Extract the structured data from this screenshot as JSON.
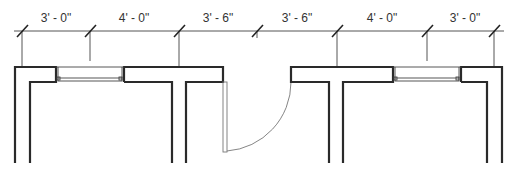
{
  "drawing": {
    "type": "architectural floor plan (partial)",
    "dimension_line": {
      "y": 31,
      "ticks_x": [
        22,
        90,
        179,
        257,
        337,
        427,
        494
      ],
      "segments": [
        {
          "label": "3' - 0\"",
          "x": 56
        },
        {
          "label": "4' - 0\"",
          "x": 134
        },
        {
          "label": "3' - 6\"",
          "x": 218
        },
        {
          "label": "3' - 6\"",
          "x": 297
        },
        {
          "label": "4' - 0\"",
          "x": 382
        },
        {
          "label": "3' - 0\"",
          "x": 465
        }
      ]
    },
    "colors": {
      "wall": "#2a2a2a",
      "dimension": "#555555",
      "text": "#333333",
      "door": "#777777",
      "background": "#ffffff"
    }
  }
}
